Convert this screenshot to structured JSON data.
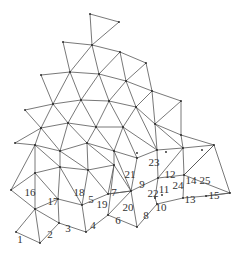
{
  "diagram": {
    "type": "triangular-mesh",
    "line_color": "#555555",
    "node_color": "#222222",
    "labels": [
      {
        "text": "1",
        "x": 20,
        "y": 243
      },
      {
        "text": "2",
        "x": 50,
        "y": 238
      },
      {
        "text": "3",
        "x": 68,
        "y": 232
      },
      {
        "text": "4",
        "x": 93,
        "y": 229
      },
      {
        "text": "5",
        "x": 91,
        "y": 203
      },
      {
        "text": "6",
        "x": 118,
        "y": 224
      },
      {
        "text": "7",
        "x": 114,
        "y": 196
      },
      {
        "text": "8",
        "x": 146,
        "y": 219
      },
      {
        "text": "9",
        "x": 142,
        "y": 188
      },
      {
        "text": "10",
        "x": 161,
        "y": 211
      },
      {
        "text": "11",
        "x": 164,
        "y": 193
      },
      {
        "text": "12",
        "x": 170,
        "y": 178
      },
      {
        "text": "13",
        "x": 190,
        "y": 203
      },
      {
        "text": "14",
        "x": 191,
        "y": 184
      },
      {
        "text": "15",
        "x": 214,
        "y": 199
      },
      {
        "text": "16",
        "x": 30,
        "y": 196
      },
      {
        "text": "17",
        "x": 53,
        "y": 205
      },
      {
        "text": "18",
        "x": 79,
        "y": 196
      },
      {
        "text": "19",
        "x": 102,
        "y": 208
      },
      {
        "text": "20",
        "x": 128,
        "y": 211
      },
      {
        "text": "21",
        "x": 130,
        "y": 178
      },
      {
        "text": "22",
        "x": 153,
        "y": 197
      },
      {
        "text": "23",
        "x": 154,
        "y": 166
      },
      {
        "text": "24",
        "x": 178,
        "y": 189
      },
      {
        "text": "25",
        "x": 205,
        "y": 184
      }
    ]
  }
}
